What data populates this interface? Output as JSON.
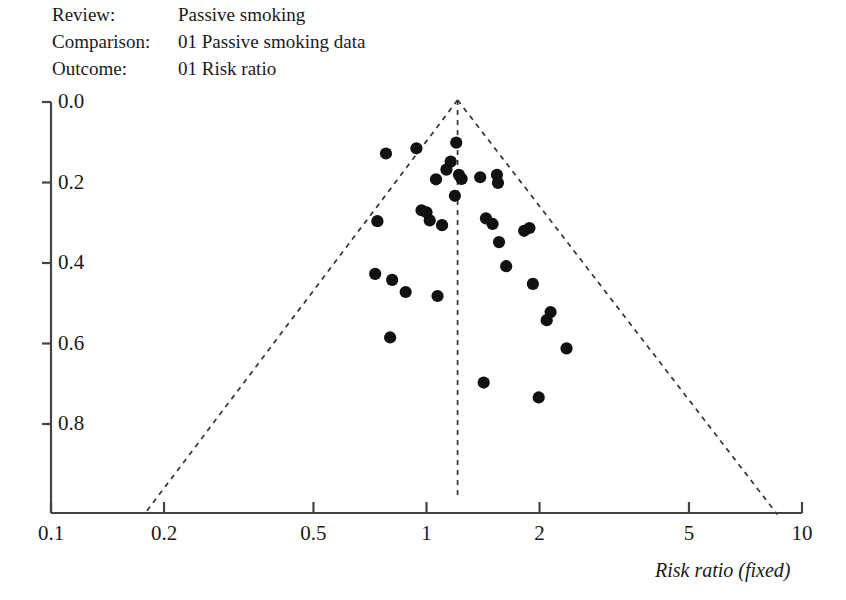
{
  "header": {
    "rows": [
      {
        "label": "Review:",
        "value": "Passive smoking"
      },
      {
        "label": "Comparison:",
        "value": "01 Passive smoking data"
      },
      {
        "label": "Outcome:",
        "value": "01 Risk ratio"
      }
    ]
  },
  "chart_data": {
    "type": "scatter",
    "title": "",
    "subtitle": "",
    "xlabel": "Risk ratio (fixed)",
    "ylabel": "",
    "xscale": "log",
    "xlim": [
      0.1,
      10
    ],
    "ylim": [
      0.0,
      1.02
    ],
    "y_inverted": true,
    "grid": false,
    "legend": null,
    "x_ticks": [
      "0.1",
      "0.2",
      "0.5",
      "1",
      "2",
      "5",
      "10"
    ],
    "x_tick_values": [
      0.1,
      0.2,
      0.5,
      1,
      2,
      5,
      10
    ],
    "y_ticks": [
      "0.0",
      "0.2",
      "0.4",
      "0.6",
      "0.8"
    ],
    "y_tick_values": [
      0.0,
      0.2,
      0.4,
      0.6,
      0.8
    ],
    "annotations": {
      "funnel_center_rr": 1.21,
      "funnel_left_base_rr": 0.177,
      "funnel_right_base_rr": 8.6,
      "funnel_base_se": 1.025,
      "center_line_style": "dashed",
      "funnel_edge_style": "dashed"
    },
    "series": [
      {
        "name": "Studies",
        "marker": "filled-circle",
        "color": "#111111",
        "points": [
          {
            "rr": 0.78,
            "se": 0.128
          },
          {
            "rr": 0.94,
            "se": 0.115
          },
          {
            "rr": 1.2,
            "se": 0.101
          },
          {
            "rr": 1.16,
            "se": 0.148
          },
          {
            "rr": 1.13,
            "se": 0.168
          },
          {
            "rr": 1.06,
            "se": 0.192
          },
          {
            "rr": 1.22,
            "se": 0.181
          },
          {
            "rr": 1.24,
            "se": 0.191
          },
          {
            "rr": 1.19,
            "se": 0.233
          },
          {
            "rr": 1.39,
            "se": 0.187
          },
          {
            "rr": 1.54,
            "se": 0.181
          },
          {
            "rr": 1.55,
            "se": 0.201
          },
          {
            "rr": 0.74,
            "se": 0.296
          },
          {
            "rr": 0.97,
            "se": 0.269
          },
          {
            "rr": 1.0,
            "se": 0.274
          },
          {
            "rr": 1.02,
            "se": 0.294
          },
          {
            "rr": 1.1,
            "se": 0.306
          },
          {
            "rr": 1.44,
            "se": 0.289
          },
          {
            "rr": 1.5,
            "se": 0.303
          },
          {
            "rr": 1.82,
            "se": 0.32
          },
          {
            "rr": 1.88,
            "se": 0.313
          },
          {
            "rr": 1.56,
            "se": 0.348
          },
          {
            "rr": 1.63,
            "se": 0.408
          },
          {
            "rr": 0.73,
            "se": 0.427
          },
          {
            "rr": 0.81,
            "se": 0.442
          },
          {
            "rr": 0.88,
            "se": 0.472
          },
          {
            "rr": 1.07,
            "se": 0.482
          },
          {
            "rr": 1.92,
            "se": 0.452
          },
          {
            "rr": 2.14,
            "se": 0.522
          },
          {
            "rr": 2.09,
            "se": 0.542
          },
          {
            "rr": 0.8,
            "se": 0.585
          },
          {
            "rr": 2.36,
            "se": 0.612
          },
          {
            "rr": 1.42,
            "se": 0.697
          },
          {
            "rr": 1.99,
            "se": 0.734
          }
        ]
      }
    ]
  }
}
